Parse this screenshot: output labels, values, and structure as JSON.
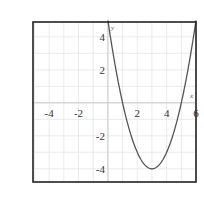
{
  "chart_data": {
    "type": "line",
    "title": "",
    "xlabel": "x",
    "ylabel": "y",
    "xlim": [
      -5.1,
      6
    ],
    "ylim": [
      -4.8,
      4.9
    ],
    "grid": true,
    "x_ticks": [
      -4,
      -2,
      2,
      4,
      6
    ],
    "y_ticks": [
      4,
      2,
      -2,
      -4
    ],
    "x_tick_labels": [
      "-4",
      "-2",
      "2",
      "4",
      "6"
    ],
    "y_tick_labels": [
      "4",
      "2",
      "-2",
      "-4"
    ],
    "series": [
      {
        "name": "y = (x-3)^2 - 4",
        "x": [
          0,
          0.5,
          1,
          1.5,
          2,
          2.5,
          3,
          3.5,
          4,
          4.5,
          5,
          5.5,
          6
        ],
        "y": [
          5,
          2.25,
          0,
          -1.75,
          -3,
          -3.75,
          -4,
          -3.75,
          -3,
          -1.75,
          0,
          2.25,
          5
        ]
      }
    ],
    "annotations": [
      "vertex near (3, -4)"
    ]
  },
  "colors": {
    "curve": "#555555",
    "grid": "#e4e4e4",
    "axis": "#cccccc",
    "frame": "#222222"
  }
}
